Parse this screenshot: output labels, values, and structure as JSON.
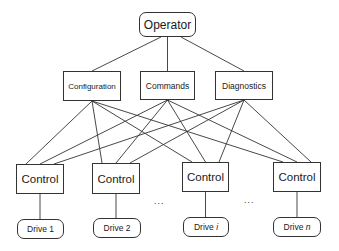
{
  "diagram": {
    "type": "hierarchy",
    "root": {
      "id": "operator",
      "label": "Operator",
      "x": 139,
      "y": 12,
      "w": 57,
      "h": 25,
      "shape": "rounded",
      "font": 12
    },
    "middle": [
      {
        "id": "configuration",
        "label": "Configuration",
        "x": 63,
        "y": 71,
        "w": 58,
        "h": 30,
        "shape": "rect",
        "font": 8
      },
      {
        "id": "commands",
        "label": "Commands",
        "x": 140,
        "y": 71,
        "w": 55,
        "h": 29,
        "shape": "rect",
        "font": 8.5
      },
      {
        "id": "diagnostics",
        "label": "Diagnostics",
        "x": 215,
        "y": 71,
        "w": 58,
        "h": 29,
        "shape": "rect",
        "font": 8.5
      }
    ],
    "controls": [
      {
        "id": "control-1",
        "label": "Control",
        "x": 16,
        "y": 164,
        "w": 48,
        "h": 30
      },
      {
        "id": "control-2",
        "label": "Control",
        "x": 92,
        "y": 163,
        "w": 48,
        "h": 31
      },
      {
        "id": "control-i",
        "label": "Control",
        "x": 182,
        "y": 162,
        "w": 47,
        "h": 30
      },
      {
        "id": "control-n",
        "label": "Control",
        "x": 273,
        "y": 162,
        "w": 48,
        "h": 30
      }
    ],
    "drives": [
      {
        "id": "drive-1",
        "label": "Drive 1",
        "x": 17,
        "y": 219,
        "w": 47,
        "h": 20
      },
      {
        "id": "drive-2",
        "label": "Drive 2",
        "x": 93,
        "y": 218,
        "w": 48,
        "h": 20
      },
      {
        "id": "drive-i",
        "label": "Drive i",
        "x": 183,
        "y": 217,
        "w": 46,
        "h": 20
      },
      {
        "id": "drive-n",
        "label": "Drive n",
        "x": 273,
        "y": 217,
        "w": 48,
        "h": 20
      }
    ],
    "ellipses": [
      {
        "text": "...",
        "x": 154,
        "y": 196
      },
      {
        "text": "...",
        "x": 244,
        "y": 195
      }
    ],
    "edges_note": "Operator connects to each middle node; each middle node connects to every Control; each Control connects to its Drive"
  }
}
